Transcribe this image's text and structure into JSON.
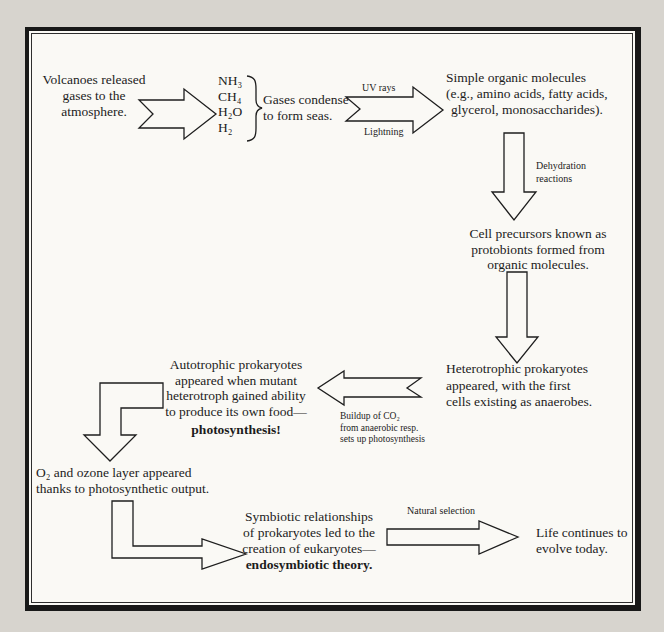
{
  "page": {
    "background": "#d7d4ce",
    "paper": "#faf9f5",
    "border_color": "#181818",
    "ink_color": "#1c1c1c"
  },
  "nodes": {
    "volcanoes": {
      "lines": [
        "Volcanoes released",
        "gases to the",
        "atmosphere."
      ]
    },
    "gases": {
      "formulas": [
        "NH₃",
        "CH₄",
        "H₂O",
        "H₂"
      ],
      "lines": [
        "Gases condense",
        "to form seas."
      ]
    },
    "organic": {
      "lines": [
        "Simple organic molecules",
        "(e.g., amino acids, fatty acids,",
        "glycerol, monosaccharides)."
      ]
    },
    "protobionts": {
      "lines": [
        "Cell precursors known as",
        "protobionts formed from",
        "organic molecules."
      ]
    },
    "heterotrophs": {
      "lines": [
        "Heterotrophic prokaryotes",
        "appeared, with the first",
        "cells existing as anaerobes."
      ]
    },
    "autotrophs": {
      "lines": [
        "Autotrophic prokaryotes",
        "appeared when mutant",
        "heterotroph gained ability",
        "to produce its own food—"
      ],
      "emphasis": "photosynthesis!"
    },
    "oxygen": {
      "lines": [
        "O₂ and ozone layer appeared",
        "thanks to photosynthetic output."
      ]
    },
    "symbiosis": {
      "lines": [
        "Symbiotic relationships",
        "of prokaryotes led to the",
        "creation of eukaryotes—"
      ],
      "emphasis": "endosymbiotic theory."
    },
    "life": {
      "lines": [
        "Life continues to",
        "evolve today."
      ]
    }
  },
  "arrow_labels": {
    "uv": "UV rays",
    "lightning": "Lightning",
    "dehydration": [
      "Dehydration",
      "reactions"
    ],
    "co2": [
      "Buildup of CO₂",
      "from anaerobic resp.",
      "sets up photosynthesis"
    ],
    "natural_selection": "Natural selection"
  }
}
